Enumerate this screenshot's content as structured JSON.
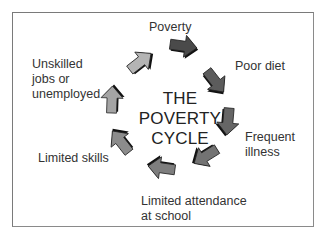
{
  "diagram": {
    "title_lines": [
      "THE",
      "POVERTY",
      "CYCLE"
    ],
    "nodes": [
      {
        "id": "poverty",
        "label_lines": [
          "Poverty"
        ]
      },
      {
        "id": "poor-diet",
        "label_lines": [
          "Poor diet"
        ]
      },
      {
        "id": "frequent-illness",
        "label_lines": [
          "Frequent",
          "illness"
        ]
      },
      {
        "id": "limited-attendance",
        "label_lines": [
          "Limited attendance",
          "at school"
        ]
      },
      {
        "id": "limited-skills",
        "label_lines": [
          "Limited skills"
        ]
      },
      {
        "id": "unskilled-jobs",
        "label_lines": [
          "Unskilled",
          "jobs or",
          "unemployed"
        ]
      }
    ],
    "arrows": [
      {
        "from": "poverty",
        "to": "poor-diet",
        "color": "#4a4a4a"
      },
      {
        "from": "poor-diet",
        "to": "frequent-illness",
        "color": "#5c5c5c"
      },
      {
        "from": "poor-diet",
        "to": "frequent-illness",
        "color": "#666666"
      },
      {
        "from": "frequent-illness",
        "to": "limited-attendance",
        "color": "#737373"
      },
      {
        "from": "limited-attendance",
        "to": "limited-skills",
        "color": "#7e7e7e"
      },
      {
        "from": "limited-skills",
        "to": "unskilled-jobs",
        "color": "#8c8c8c"
      },
      {
        "from": "unskilled-jobs",
        "to": "unskilled-jobs",
        "color": "#a4a4a4"
      },
      {
        "from": "unskilled-jobs",
        "to": "poverty",
        "color": "#b4b4b4"
      }
    ]
  }
}
